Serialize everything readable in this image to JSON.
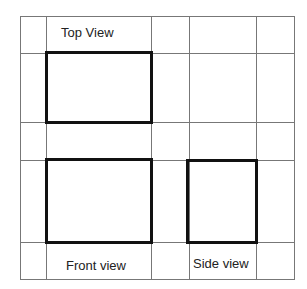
{
  "diagram": {
    "labels": {
      "top": "Top View",
      "front": "Front view",
      "side": "Side view"
    },
    "grid": {
      "vertical_lines_x": [
        20,
        46,
        151,
        189,
        256,
        294
      ],
      "horizontal_lines_y": [
        16,
        53,
        122,
        160,
        242,
        279
      ],
      "line_color": "#777777"
    },
    "views": [
      {
        "name": "top",
        "x": 46,
        "y": 52,
        "w": 106,
        "h": 71
      },
      {
        "name": "front",
        "x": 46,
        "y": 159,
        "w": 106,
        "h": 84
      },
      {
        "name": "side",
        "x": 187,
        "y": 160,
        "w": 70,
        "h": 83
      }
    ],
    "outline_color": "#111111"
  }
}
